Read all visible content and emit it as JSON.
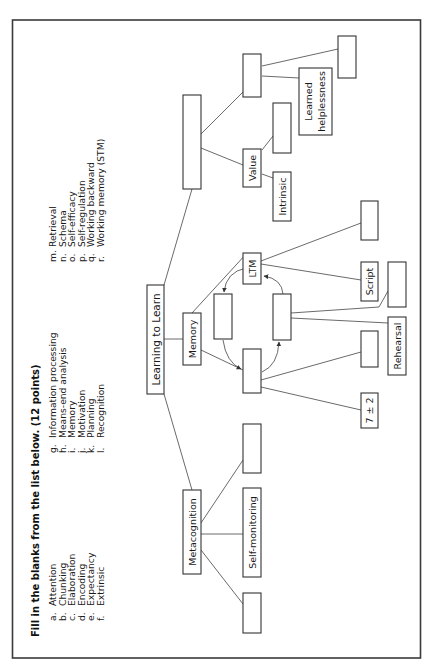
{
  "instructions": {
    "title": "Fill in the blanks from the list below. (12 points)"
  },
  "word_bank": {
    "column_1": [
      {
        "letter": "a.",
        "term": "Attention"
      },
      {
        "letter": "b.",
        "term": "Chunking"
      },
      {
        "letter": "c.",
        "term": "Elaboration"
      },
      {
        "letter": "d.",
        "term": "Encoding"
      },
      {
        "letter": "e.",
        "term": "Expectancy"
      },
      {
        "letter": "f.",
        "term": "Extrinsic"
      }
    ],
    "column_2": [
      {
        "letter": "g.",
        "term": "Information processing"
      },
      {
        "letter": "h.",
        "term": "Means-end analysis"
      },
      {
        "letter": "i.",
        "term": "Memory"
      },
      {
        "letter": "j.",
        "term": "Motivation"
      },
      {
        "letter": "k.",
        "term": "Planning"
      },
      {
        "letter": "l.",
        "term": "Recognition"
      }
    ],
    "column_3": [
      {
        "letter": "m.",
        "term": "Retrieval"
      },
      {
        "letter": "n.",
        "term": "Schema"
      },
      {
        "letter": "o.",
        "term": "Self-efficacy"
      },
      {
        "letter": "p.",
        "term": "Self-regulation"
      },
      {
        "letter": "q.",
        "term": "Working backward"
      },
      {
        "letter": "r.",
        "term": "Working memory (STM)"
      }
    ]
  },
  "concept_map": {
    "root": "Learning to Learn",
    "nodes": {
      "memory": "Memory",
      "metacognition": "Metacognition",
      "ltm": "LTM",
      "script": "Script",
      "rehearsal": "Rehearsal",
      "seven_plus_minus_two": "7 ± 2",
      "value": "Value",
      "intrinsic": "Intrinsic",
      "learned_helplessness_line1": "Learned",
      "learned_helplessness_line2": "helplessness",
      "self_monitoring": "Self-monitoring"
    },
    "blank_count": 12
  }
}
